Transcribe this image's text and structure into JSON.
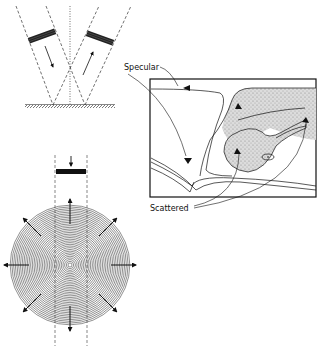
{
  "figure": {
    "labels": {
      "specular": "Specular",
      "scattered": "Scattered"
    },
    "panels": [
      {
        "id": "specular-reflection",
        "caption": "Beam reflected from smooth interface"
      },
      {
        "id": "scattered-reflection",
        "caption": "Beam scattered by rough target in all directions"
      },
      {
        "id": "anatomy-scan",
        "caption": "Scan section showing specular and scattered echoes"
      }
    ],
    "colors": {
      "ink": "#111111",
      "stipple": "#9a9a9a",
      "background": "#ffffff"
    }
  }
}
